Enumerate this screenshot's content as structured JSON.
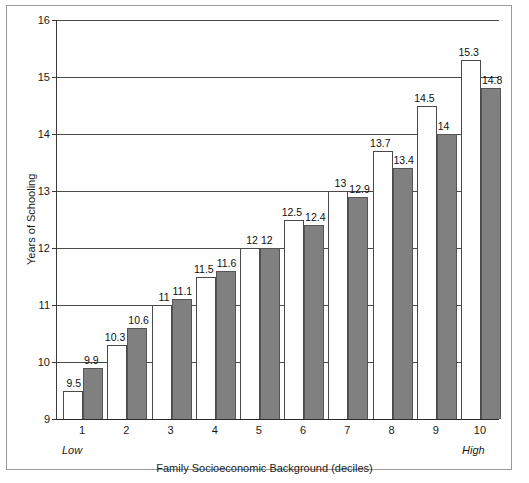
{
  "chart_data": {
    "type": "bar",
    "title": "",
    "xlabel": "Family Socioeconomic Background (deciles)",
    "ylabel": "Years of Schooling",
    "categories": [
      "1",
      "2",
      "3",
      "4",
      "5",
      "6",
      "7",
      "8",
      "9",
      "10"
    ],
    "x_edge_labels": {
      "left": "Low",
      "right": "High"
    },
    "ylim": [
      9,
      16
    ],
    "yticks": [
      "9",
      "10",
      "11",
      "12",
      "13",
      "14",
      "15",
      "16"
    ],
    "grid": true,
    "legend": "none",
    "series": [
      {
        "name": "white",
        "values": [
          9.5,
          10.3,
          11,
          11.5,
          12,
          12.5,
          13,
          13.7,
          14.5,
          15.3
        ],
        "labels": [
          "9.5",
          "10.3",
          "11",
          "11.5",
          "12",
          "12.5",
          "13",
          "13.7",
          "14.5",
          "15.3"
        ],
        "color": "#ffffff"
      },
      {
        "name": "gray",
        "values": [
          9.9,
          10.6,
          11.1,
          11.6,
          12,
          12.4,
          12.9,
          13.4,
          14,
          14.8
        ],
        "labels": [
          "9.9",
          "10.6",
          "11.1",
          "11.6",
          "12",
          "12.4",
          "12.9",
          "13.4",
          "14",
          "14.8"
        ],
        "color": "#808080"
      }
    ]
  }
}
